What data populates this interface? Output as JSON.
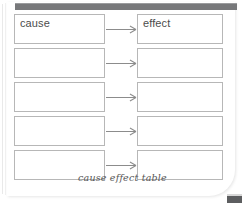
{
  "document": {
    "caption": "cause effect table",
    "top_bar": {
      "color": "#77787a"
    },
    "corner_tab": {
      "color": "#5d5e60"
    },
    "border_color": "#b7b7b7",
    "text_color": "#4c4c4c",
    "arrow_color": "#8c8c8c"
  },
  "table": {
    "columns": [
      "cause",
      "effect"
    ],
    "rows": [
      {
        "cause": "cause",
        "effect": "effect",
        "arrow": true
      },
      {
        "cause": "",
        "effect": "",
        "arrow": true
      },
      {
        "cause": "",
        "effect": "",
        "arrow": true
      },
      {
        "cause": "",
        "effect": "",
        "arrow": true
      },
      {
        "cause": "",
        "effect": "",
        "arrow": true
      }
    ]
  }
}
